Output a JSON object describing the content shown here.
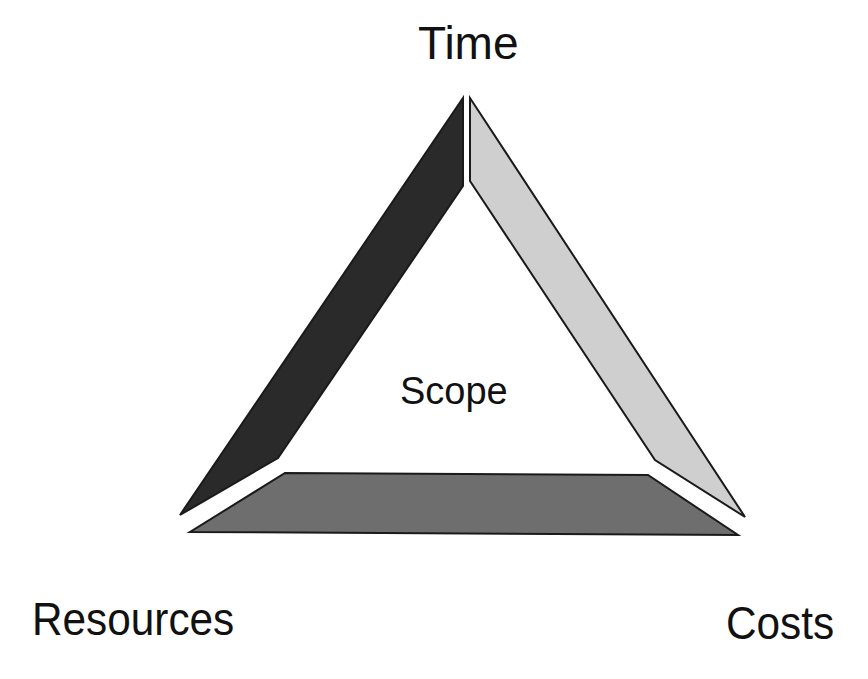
{
  "diagram": {
    "labels": {
      "top": "Time",
      "center": "Scope",
      "bottom_left": "Resources",
      "bottom_right": "Costs"
    },
    "sides": [
      {
        "name": "left",
        "color": "#2a2a2a"
      },
      {
        "name": "right",
        "color": "#cfcfcf"
      },
      {
        "name": "bottom",
        "color": "#6e6e6e"
      }
    ],
    "outline_color": "#1a1a1a"
  }
}
